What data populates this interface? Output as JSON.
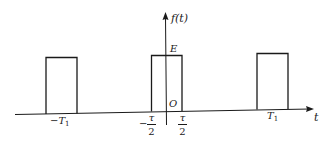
{
  "diagram": {
    "axes": {
      "x_label": "t",
      "y_label": "f(t)",
      "origin_label": "O"
    },
    "amplitude_label": "E",
    "tick_labels": {
      "neg_period": {
        "sign": "−",
        "symbol": "T",
        "subscript": "1"
      },
      "pos_period": {
        "symbol": "T",
        "subscript": "1"
      },
      "neg_half_width": {
        "sign": "−",
        "numerator": "τ",
        "denominator": "2"
      },
      "pos_half_width": {
        "numerator": "τ",
        "denominator": "2"
      }
    },
    "pulses": [
      {
        "name": "pulse-at-neg-T1",
        "x0": 45,
        "x1": 77,
        "top": 57,
        "base": 114
      },
      {
        "name": "pulse-at-origin",
        "x0": 151,
        "x1": 182,
        "top": 55,
        "base": 111
      },
      {
        "name": "pulse-at-T1",
        "x0": 257,
        "x1": 288,
        "top": 53,
        "base": 109
      }
    ],
    "colors": {
      "stroke": "#1a1a1a",
      "background": "#ffffff"
    }
  }
}
